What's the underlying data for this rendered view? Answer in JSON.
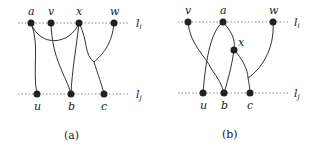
{
  "panels": [
    {
      "caption": "(a)",
      "line_labels": {
        "top": "l_i",
        "bottom": "l_j"
      },
      "top_nodes": [
        {
          "label": "a",
          "x": 31,
          "y": 23
        },
        {
          "label": "v",
          "x": 51,
          "y": 23
        },
        {
          "label": "x",
          "x": 79,
          "y": 23
        },
        {
          "label": "w",
          "x": 114,
          "y": 23
        }
      ],
      "bottom_nodes": [
        {
          "label": "u",
          "x": 37,
          "y": 94
        },
        {
          "label": "b",
          "x": 71,
          "y": 94
        },
        {
          "label": "c",
          "x": 104,
          "y": 94
        }
      ],
      "edges": [
        [
          "a",
          "u"
        ],
        [
          "a",
          "x"
        ],
        [
          "v",
          "b"
        ],
        [
          "x",
          "b"
        ],
        [
          "x",
          "c"
        ],
        [
          "w",
          "c"
        ]
      ]
    },
    {
      "caption": "(b)",
      "line_labels": {
        "top": "l_i",
        "bottom": "l_j"
      },
      "top_nodes": [
        {
          "label": "v",
          "x": 188,
          "y": 22
        },
        {
          "label": "a",
          "x": 223,
          "y": 22
        },
        {
          "label": "w",
          "x": 273,
          "y": 22
        }
      ],
      "middle_nodes": [
        {
          "label": "x",
          "x": 234,
          "y": 50
        }
      ],
      "bottom_nodes": [
        {
          "label": "u",
          "x": 203,
          "y": 93
        },
        {
          "label": "b",
          "x": 224,
          "y": 93
        },
        {
          "label": "c",
          "x": 250,
          "y": 93
        }
      ],
      "edges": [
        [
          "v",
          "b"
        ],
        [
          "a",
          "u"
        ],
        [
          "a",
          "x"
        ],
        [
          "x",
          "b"
        ],
        [
          "x",
          "c"
        ],
        [
          "w",
          "c"
        ]
      ]
    }
  ]
}
